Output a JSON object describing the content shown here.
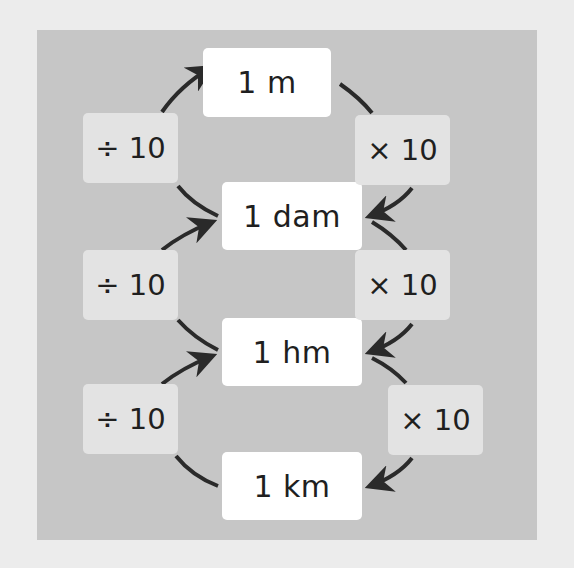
{
  "diagram": {
    "title": "",
    "units": [
      {
        "id": "m",
        "label": "1 m"
      },
      {
        "id": "dam",
        "label": "1 dam"
      },
      {
        "id": "hm",
        "label": "1 hm"
      },
      {
        "id": "km",
        "label": "1 km"
      }
    ],
    "left_operations": [
      {
        "label": "÷ 10",
        "direction": "up",
        "from": "1 dam",
        "to": "1 m"
      },
      {
        "label": "÷ 10",
        "direction": "up",
        "from": "1 hm",
        "to": "1 dam"
      },
      {
        "label": "÷ 10",
        "direction": "up",
        "from": "1 km",
        "to": "1 hm"
      }
    ],
    "right_operations": [
      {
        "label": "× 10",
        "direction": "down",
        "from": "1 m",
        "to": "1 dam"
      },
      {
        "label": "× 10",
        "direction": "down",
        "from": "1 dam",
        "to": "1 hm"
      },
      {
        "label": "× 10",
        "direction": "down",
        "from": "1 hm",
        "to": "1 km"
      }
    ],
    "colors": {
      "page_background": "#ececec",
      "panel_background": "#c6c6c6",
      "unit_box": "#ffffff",
      "operation_box": "#e3e3e3",
      "arrow": "#2a2a2a",
      "text": "#1f1f1f"
    }
  }
}
